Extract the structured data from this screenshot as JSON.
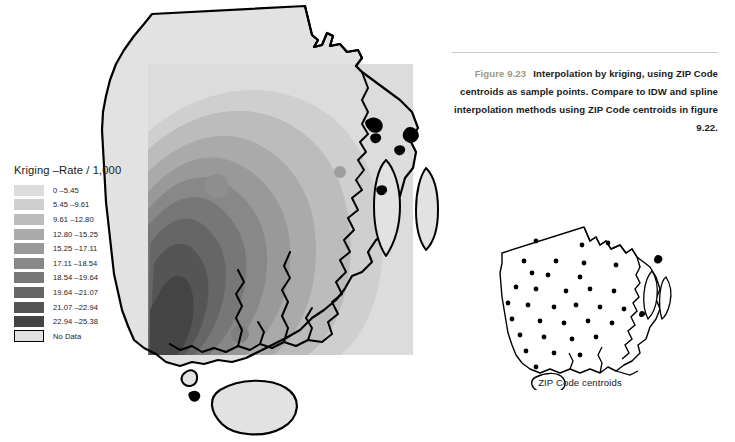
{
  "figure": {
    "number": "Figure 9.23",
    "caption": "Interpolation by kriging, using ZIP Code centroids as sample points. Compare to IDW and spline interpolation methods using ZIP Code centroids in figure 9.22.",
    "figno_color": "#9a9a7e",
    "rule_color": "#c9c9c4"
  },
  "legend": {
    "title": "Kriging –Rate / 1,000",
    "items": [
      {
        "label": "0 –5.45",
        "color": "#dcdcdc"
      },
      {
        "label": "5.45 –9.61",
        "color": "#cfcfcf"
      },
      {
        "label": "9.61 –12.80",
        "color": "#bcbcbc"
      },
      {
        "label": "12.80 –15.25",
        "color": "#aaaaaa"
      },
      {
        "label": "15.25 –17.11",
        "color": "#999999"
      },
      {
        "label": "17.11 –18.54",
        "color": "#888888"
      },
      {
        "label": "18.54 –19.64",
        "color": "#777777"
      },
      {
        "label": "19.64 –21.07",
        "color": "#666666"
      },
      {
        "label": "21.07 –22.94",
        "color": "#555555"
      },
      {
        "label": "22.94 –25.38",
        "color": "#444444"
      },
      {
        "label": "No Data",
        "color": "#e2e2e2"
      }
    ]
  },
  "main_map": {
    "name": "kriging-surface-map",
    "no_data_fill": "#e2e2e2",
    "outline_color": "#000000",
    "raster_rect": {
      "x": 148,
      "y": 64,
      "width": 265,
      "height": 291
    }
  },
  "inset_map": {
    "name": "zip-code-centroids-map",
    "caption": "ZIP Code centroids",
    "dot_color": "#000000",
    "outline_color": "#000000",
    "dot_count": 34
  }
}
